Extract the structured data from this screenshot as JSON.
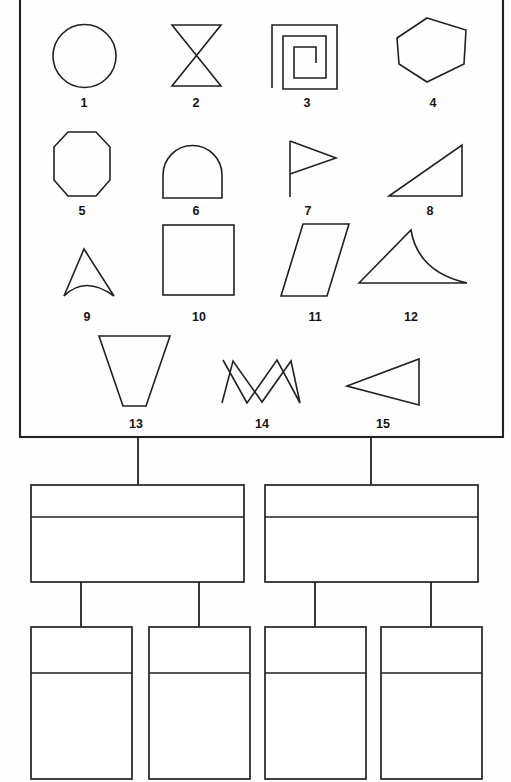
{
  "figure": {
    "title": "",
    "shape_panel": {
      "name": "shape-legend-panel",
      "border_color": "#222222",
      "background": "#fefefe",
      "bounds": {
        "x": 20,
        "y": -6,
        "width": 483,
        "height": 443
      },
      "shapes": [
        {
          "id": 1,
          "label": "1",
          "name": "circle",
          "kind": "circle"
        },
        {
          "id": 2,
          "label": "2",
          "name": "bowtie",
          "kind": "bowtie"
        },
        {
          "id": 3,
          "label": "3",
          "name": "square-spiral",
          "kind": "spiral"
        },
        {
          "id": 4,
          "label": "4",
          "name": "hexagon",
          "kind": "hexagon"
        },
        {
          "id": 5,
          "label": "5",
          "name": "octagon",
          "kind": "octagon"
        },
        {
          "id": 6,
          "label": "6",
          "name": "dome-semicircle",
          "kind": "dome"
        },
        {
          "id": 7,
          "label": "7",
          "name": "flag",
          "kind": "flag"
        },
        {
          "id": 8,
          "label": "8",
          "name": "right-triangle",
          "kind": "right-triangle"
        },
        {
          "id": 9,
          "label": "9",
          "name": "concave-arrowhead",
          "kind": "arrowhead"
        },
        {
          "id": 10,
          "label": "10",
          "name": "square",
          "kind": "square"
        },
        {
          "id": 11,
          "label": "11",
          "name": "parallelogram",
          "kind": "parallelogram"
        },
        {
          "id": 12,
          "label": "12",
          "name": "curved-spike-triangle",
          "kind": "spike"
        },
        {
          "id": 13,
          "label": "13",
          "name": "inverted-trapezoid",
          "kind": "trapezoid"
        },
        {
          "id": 14,
          "label": "14",
          "name": "crossing-zigzag",
          "kind": "zigzag"
        },
        {
          "id": 15,
          "label": "15",
          "name": "left-pointing-triangle",
          "kind": "left-triangle"
        }
      ]
    },
    "tree": {
      "name": "hierarchy-tree",
      "note": "blank two-level node tree beneath the shape panel",
      "levels": [
        {
          "level": 2,
          "nodes": [
            {
              "name": "tree-node-level2-left",
              "header_text": "",
              "body_text": "",
              "x": 31,
              "y": 485,
              "width": 213,
              "height": 97,
              "divider_y": 517
            },
            {
              "name": "tree-node-level2-right",
              "header_text": "",
              "body_text": "",
              "x": 265,
              "y": 485,
              "width": 213,
              "height": 97,
              "divider_y": 517
            }
          ]
        },
        {
          "level": 3,
          "nodes": [
            {
              "name": "tree-node-level3-1",
              "header_text": "",
              "body_text": "",
              "x": 31,
              "y": 627,
              "width": 101,
              "height": 147,
              "divider_y": 673
            },
            {
              "name": "tree-node-level3-2",
              "header_text": "",
              "body_text": "",
              "x": 149,
              "y": 627,
              "width": 101,
              "height": 147,
              "divider_y": 673
            },
            {
              "name": "tree-node-level3-3",
              "header_text": "",
              "body_text": "",
              "x": 265,
              "y": 627,
              "width": 101,
              "height": 147,
              "divider_y": 673
            },
            {
              "name": "tree-node-level3-4",
              "header_text": "",
              "body_text": "",
              "x": 381,
              "y": 627,
              "width": 101,
              "height": 147,
              "divider_y": 673
            }
          ]
        }
      ],
      "connectors": [
        {
          "name": "connector-panel-to-left",
          "x1": 138,
          "y1": 437,
          "x2": 138,
          "y2": 485
        },
        {
          "name": "connector-panel-to-right",
          "x1": 371,
          "y1": 437,
          "x2": 371,
          "y2": 485
        },
        {
          "name": "connector-left-to-child1",
          "x1": 81,
          "y1": 582,
          "x2": 81,
          "y2": 627
        },
        {
          "name": "connector-left-to-child2",
          "x1": 199,
          "y1": 582,
          "x2": 199,
          "y2": 627
        },
        {
          "name": "connector-right-to-child3",
          "x1": 315,
          "y1": 582,
          "x2": 315,
          "y2": 627
        },
        {
          "name": "connector-right-to-child4",
          "x1": 431,
          "y1": 582,
          "x2": 431,
          "y2": 627
        }
      ]
    }
  }
}
